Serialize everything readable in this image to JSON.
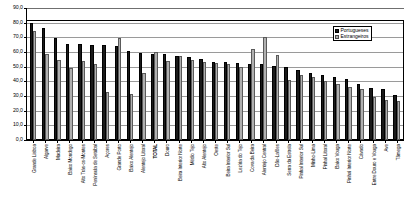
{
  "chart_data": {
    "type": "bar",
    "title": "",
    "xlabel": "",
    "ylabel": "",
    "ylim": [
      0.0,
      90.0
    ],
    "ytick_step": 10.0,
    "ytick_labels": [
      "90,0",
      "80,0",
      "70,0",
      "60,0",
      "50,0",
      "40,0",
      "30,0",
      "20,0",
      "10,0",
      "0,0"
    ],
    "grid": true,
    "legend_position": "top-right",
    "categories": [
      "Grande Lisboa",
      "Algarve",
      "Madeira",
      "Baixo Mondego",
      "Alto Trás-os-Montes",
      "Península de Setúbal",
      "Açores",
      "Grande Porto",
      "Baixo Alentejo",
      "Alentejo Litoral",
      "TOTAL",
      "Douro",
      "Beira Interior Norte",
      "Médio Tejo",
      "Alto Alentejo",
      "Oeste",
      "Beira Interior Sul",
      "Lezíria do Tejo",
      "Cova da Beira",
      "Alentejo Central",
      "Dão-Lafões",
      "Serra da Estrela",
      "Pinhal Interior Sul",
      "Minho-Lima",
      "Pinhal Litoral",
      "Baixo Vouga",
      "Pinhal Interior Norte",
      "Cávado",
      "Entre Douro e Vouga",
      "Ave",
      "Tâmega"
    ],
    "series": [
      {
        "name": "Portugueses",
        "color": "#1a1a1a",
        "values": [
          80.0,
          76.5,
          69.5,
          65.8,
          65.3,
          65.0,
          64.8,
          64.0,
          60.5,
          59.2,
          58.8,
          58.5,
          57.0,
          56.3,
          55.0,
          53.5,
          53.0,
          52.5,
          52.0,
          51.5,
          50.5,
          49.5,
          47.5,
          46.0,
          44.5,
          43.0,
          41.5,
          38.5,
          35.5,
          34.5,
          30.5
        ],
        "unit": "%"
      },
      {
        "name": "Estrangeiros",
        "color": "#b0b0b0",
        "values": [
          74.0,
          58.5,
          54.3,
          49.0,
          54.0,
          51.8,
          33.0,
          69.5,
          31.5,
          45.5,
          60.0,
          54.0,
          57.5,
          54.8,
          53.3,
          52.5,
          51.5,
          50.0,
          62.0,
          70.5,
          58.0,
          41.0,
          44.5,
          43.0,
          40.0,
          38.0,
          36.0,
          35.0,
          29.5,
          27.5,
          26.5
        ],
        "unit": "%"
      }
    ]
  },
  "legend": {
    "items": [
      {
        "label": "Portugueses",
        "swatch": "pt"
      },
      {
        "label": "Estrangeiros",
        "swatch": "es"
      }
    ]
  }
}
